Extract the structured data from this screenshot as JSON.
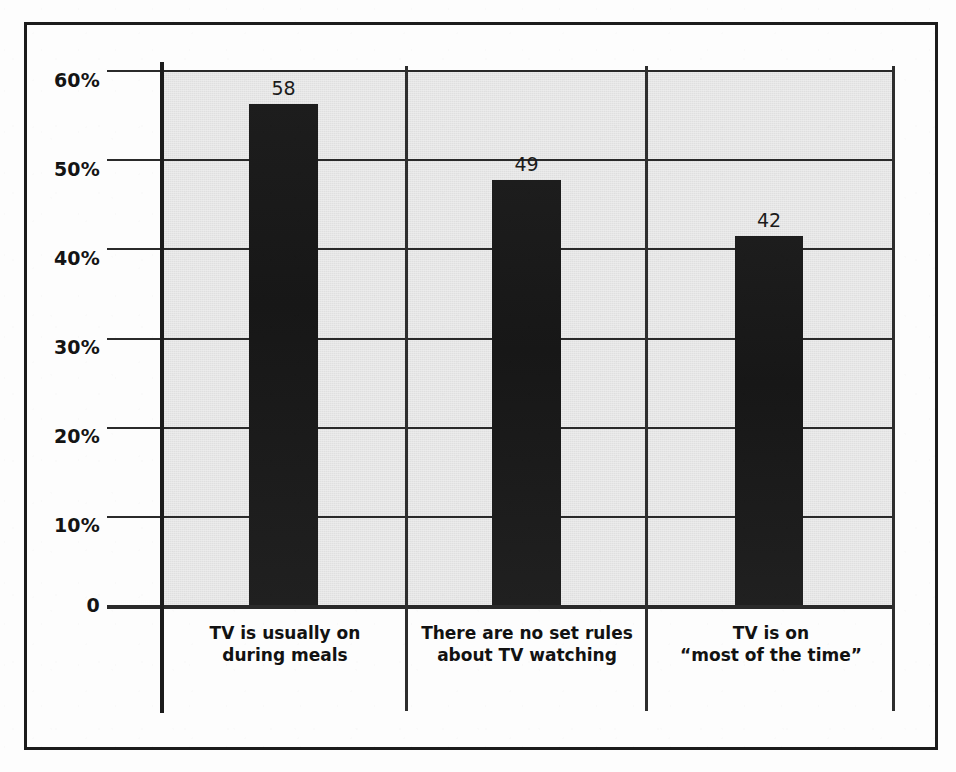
{
  "chart_data": {
    "type": "bar",
    "title": "",
    "subtitle": "",
    "xlabel": "",
    "ylabel": "",
    "categories": [
      "TV is usually on\nduring meals",
      "There are no set rules\nabout TV watching",
      "TV is on\n“most of the time”"
    ],
    "values": [
      58,
      49,
      42
    ],
    "value_labels": [
      "58",
      "49",
      "42"
    ],
    "ylim": [
      0,
      60
    ],
    "yticks": [
      0,
      10,
      20,
      30,
      40,
      50,
      60
    ],
    "ytick_labels": [
      "0",
      "10%",
      "20%",
      "30%",
      "40%",
      "50%",
      "60%"
    ],
    "grid": "horizontal",
    "legend": "none",
    "bar_color": "#1a1a1a",
    "plot_background": "#e4e4e4",
    "axis_color": "#1c1c1c"
  },
  "axis": {
    "ticks": [
      {
        "label": "60%",
        "value": 60
      },
      {
        "label": "50%",
        "value": 50
      },
      {
        "label": "40%",
        "value": 40
      },
      {
        "label": "30%",
        "value": 30
      },
      {
        "label": "20%",
        "value": 20
      },
      {
        "label": "10%",
        "value": 10
      },
      {
        "label": "0",
        "value": 0
      }
    ]
  },
  "bars": [
    {
      "value_label": "58",
      "category": "TV is usually on\nduring meals"
    },
    {
      "value_label": "49",
      "category": "There are no set rules\nabout TV watching"
    },
    {
      "value_label": "42",
      "category": "TV is on\n“most of the time”"
    }
  ]
}
